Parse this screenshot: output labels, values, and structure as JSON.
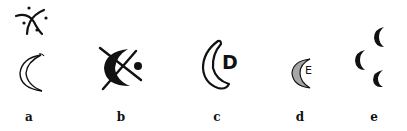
{
  "figure": {
    "panels": [
      {
        "id": "a",
        "label": "a",
        "description": "Star/cross of curved strokes with four dots above a double-lined crescent"
      },
      {
        "id": "b",
        "label": "b",
        "description": "Thick crescent crossed by an X with a dot"
      },
      {
        "id": "c",
        "label": "c",
        "description": "Outlined crescent with letter D",
        "letter": "D"
      },
      {
        "id": "d",
        "label": "d",
        "description": "Hatched crescent with letter E",
        "letter": "E"
      },
      {
        "id": "e",
        "label": "e",
        "description": "Three small crescents arranged in a triangle"
      }
    ],
    "colors": {
      "ink": "#111111",
      "background": "#ffffff"
    }
  }
}
